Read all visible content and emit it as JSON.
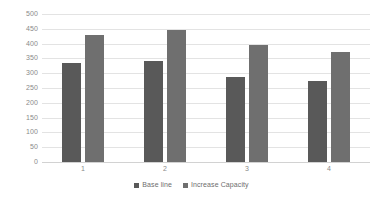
{
  "chart_data": {
    "type": "bar",
    "title": "",
    "subtitle": "",
    "xlabel": "",
    "ylabel": "",
    "categories": [
      "1",
      "2",
      "3",
      "4"
    ],
    "series": [
      {
        "name": "Base line",
        "color": "#595959",
        "values": [
          335,
          340,
          288,
          275
        ]
      },
      {
        "name": "Increase Capacity",
        "color": "#6f6f6f",
        "values": [
          430,
          447,
          395,
          372
        ]
      }
    ],
    "ylim": [
      0,
      500
    ],
    "ytick_step": 50,
    "yticks": [
      500,
      450,
      400,
      350,
      300,
      250,
      200,
      150,
      100,
      50,
      0
    ],
    "ytick_labels": [
      "500",
      "450",
      "400",
      "350",
      "300",
      "250",
      "200",
      "150",
      "100",
      "50",
      "0"
    ],
    "grid": {
      "horizontal": true,
      "vertical": false,
      "color": "#e3e3e3"
    },
    "legend": {
      "position": "bottom",
      "entries": [
        "Base line",
        "Increase Capacity"
      ]
    },
    "annotations": [],
    "background": "#ffffff",
    "axis_label_color": "#8a8a8a"
  }
}
